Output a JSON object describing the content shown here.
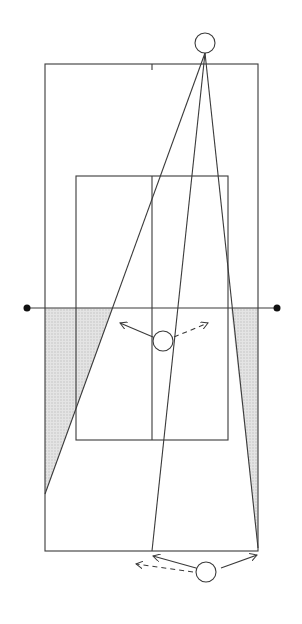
{
  "diagram": {
    "colors": {
      "line": "#3a3a3a",
      "shade": "#d8d8d8",
      "background": "#ffffff"
    },
    "court": {
      "outer": {
        "x1": 45,
        "y1": 64,
        "x2": 258,
        "y2": 551
      },
      "service_box": {
        "x1": 76,
        "y1": 176,
        "x2": 228,
        "y2": 440
      },
      "center_x": 152,
      "net_y": 308,
      "net_posts": [
        {
          "x": 27,
          "y": 308
        },
        {
          "x": 277,
          "y": 308
        }
      ]
    },
    "players": [
      {
        "id": "top-player",
        "cx": 205,
        "cy": 43,
        "r": 10
      },
      {
        "id": "net-player",
        "cx": 163,
        "cy": 341,
        "r": 10
      },
      {
        "id": "baseline-player",
        "cx": 206,
        "cy": 572,
        "r": 10
      }
    ],
    "shot_lines": [
      {
        "x1": 205,
        "y1": 53,
        "x2": 45,
        "y2": 494
      },
      {
        "x1": 205,
        "y1": 53,
        "x2": 152,
        "y2": 551
      },
      {
        "x1": 205,
        "y1": 53,
        "x2": 258,
        "y2": 548
      }
    ],
    "shaded_zones": [
      {
        "points": "45,308 113,308 45,494"
      },
      {
        "points": "231,308 258,308 258,548"
      }
    ],
    "movement_arrows": [
      {
        "x1": 153,
        "y1": 337,
        "x2": 120,
        "y2": 323,
        "style": "solid"
      },
      {
        "x1": 174,
        "y1": 337,
        "x2": 208,
        "y2": 323,
        "style": "dashed"
      },
      {
        "x1": 196,
        "y1": 568,
        "x2": 153,
        "y2": 556,
        "style": "solid"
      },
      {
        "x1": 193,
        "y1": 572,
        "x2": 136,
        "y2": 564,
        "style": "dashed"
      },
      {
        "x1": 221,
        "y1": 568,
        "x2": 257,
        "y2": 555,
        "style": "solid"
      }
    ]
  }
}
